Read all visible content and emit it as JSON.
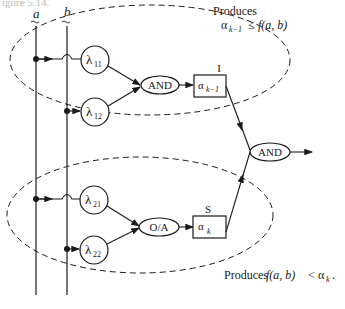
{
  "figure": {
    "caption_fragment": "igure 5.14.",
    "inputs": [
      {
        "label": "a",
        "decoration": "tilde-under"
      },
      {
        "label": "b",
        "decoration": "tilde-under"
      }
    ],
    "top_group": {
      "annotation_line1": "Produces",
      "annotation_line2_prefix": "α",
      "annotation_line2_sub": "k−1",
      "annotation_line2_rel": "≤",
      "annotation_line2_func": "f(a, b)",
      "lambda_nodes": [
        {
          "symbol": "λ",
          "sub": "11"
        },
        {
          "symbol": "λ",
          "sub": "12"
        }
      ],
      "gate": "AND",
      "register_label": "I",
      "register_symbol": "α",
      "register_sub": "k−1"
    },
    "bottom_group": {
      "annotation_prefix": "Produces",
      "annotation_func": "f(a, b)",
      "annotation_rel": "<",
      "annotation_symbol": "α",
      "annotation_sub": "k",
      "annotation_end": ".",
      "lambda_nodes": [
        {
          "symbol": "λ",
          "sub": "21"
        },
        {
          "symbol": "λ",
          "sub": "22"
        }
      ],
      "gate": "O/A",
      "register_label": "S",
      "register_symbol": "α",
      "register_sub": "k"
    },
    "output_gate": "AND",
    "colors": {
      "ink": "#1a1a1a",
      "background": "#ffffff"
    }
  }
}
